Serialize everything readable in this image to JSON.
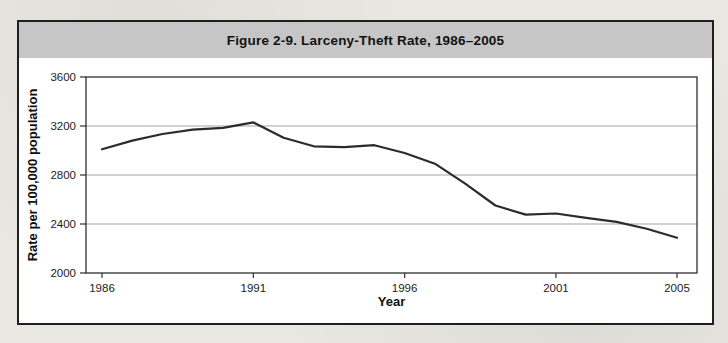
{
  "figure": {
    "title": "Figure 2-9. Larceny-Theft Rate, 1986–2005"
  },
  "chart_data": {
    "type": "line",
    "title": "Figure 2-9. Larceny-Theft Rate, 1986–2005",
    "xlabel": "Year",
    "ylabel": "Rate per 100,000 population",
    "x": [
      1986,
      1987,
      1988,
      1989,
      1990,
      1991,
      1992,
      1993,
      1994,
      1995,
      1996,
      1997,
      1998,
      1999,
      2000,
      2001,
      2002,
      2003,
      2004,
      2005
    ],
    "values": [
      3010,
      3081,
      3135,
      3171,
      3185,
      3229,
      3104,
      3034,
      3027,
      3043,
      2980,
      2892,
      2730,
      2551,
      2477,
      2486,
      2451,
      2417,
      2362,
      2287
    ],
    "ylim": [
      2000,
      3600
    ],
    "yticks": [
      2000,
      2400,
      2800,
      3200,
      3600
    ],
    "xticks": [
      1986,
      1991,
      1996,
      2001,
      2005
    ],
    "grid": true,
    "legend": "none",
    "colors": {
      "line": "#2b2b2b",
      "grid": "#a3a3a3",
      "axis": "#2e2e2e",
      "title_band": "#c6c6c6",
      "frame_border": "#1f1f1f",
      "plot_background": "#ffffff"
    }
  }
}
